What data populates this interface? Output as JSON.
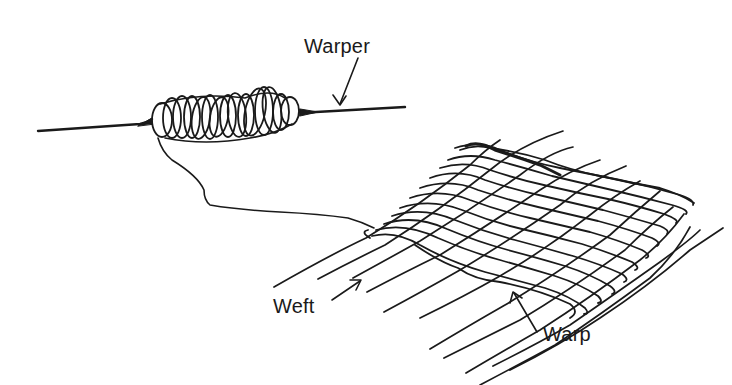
{
  "diagram": {
    "labels": {
      "warper": "Warper",
      "weft": "Weft",
      "warp": "Warp"
    },
    "colors": {
      "ink": "#1a1a1a",
      "background": "#ffffff"
    }
  }
}
